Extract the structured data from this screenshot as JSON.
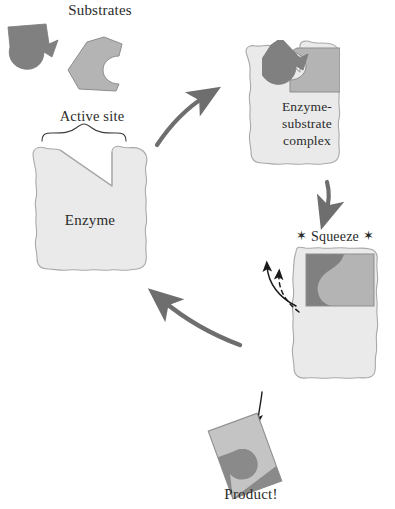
{
  "diagram": {
    "labels": {
      "substrates": "Substrates",
      "active_site": "Active site",
      "enzyme": "Enzyme",
      "complex_line1": "Enzyme-",
      "complex_line2": "substrate",
      "complex_line3": "complex",
      "squeeze": "Squeeze",
      "squeeze_star_left": "✶",
      "squeeze_star_right": "✶",
      "product": "Product!"
    },
    "colors": {
      "background": "#ffffff",
      "enzyme_fill": "#eaeaea",
      "enzyme_stroke": "#a9a9a9",
      "substrate_dark": "#808080",
      "substrate_light": "#b4b4b4",
      "substrate_stroke": "#8d8d8d",
      "arrow_gray": "#6e6e6e",
      "arrow_black": "#1a1a1a",
      "text": "#2b2b2b"
    },
    "stages": [
      {
        "id": "substrates",
        "name": "free substrates",
        "shapes": [
          "dark-substrate",
          "light-substrate"
        ]
      },
      {
        "id": "enzyme",
        "name": "free enzyme with open active site",
        "shapes": [
          "enzyme-body",
          "active-site-notch",
          "active-site-brace"
        ]
      },
      {
        "id": "enzyme-substrate-complex",
        "name": "substrates bound in active site",
        "shapes": [
          "enzyme-body",
          "dark-substrate-bound",
          "light-substrate-bound"
        ]
      },
      {
        "id": "squeeze",
        "name": "induced fit squeeze forms product",
        "shapes": [
          "enzyme-body-closed",
          "merged-product",
          "squeeze-solid-arrow",
          "squeeze-dashed-arrow"
        ]
      },
      {
        "id": "product",
        "name": "released product",
        "shapes": [
          "product-rectangle",
          "product-arrow"
        ]
      }
    ],
    "arrows": [
      {
        "id": "arrow-binding",
        "from": "substrates",
        "to": "enzyme-substrate-complex",
        "style": "curved-solid",
        "color": "#6e6e6e"
      },
      {
        "id": "arrow-to-squeeze",
        "from": "enzyme-substrate-complex",
        "to": "squeeze",
        "style": "straight-down",
        "color": "#6e6e6e"
      },
      {
        "id": "arrow-recycle",
        "from": "squeeze",
        "to": "enzyme",
        "style": "curved-solid",
        "color": "#6e6e6e"
      },
      {
        "id": "arrow-product-release",
        "from": "squeeze",
        "to": "product",
        "style": "thin-down",
        "color": "#1a1a1a"
      },
      {
        "id": "arrow-squeeze-solid",
        "from": "enzyme-edge",
        "to": "up-left",
        "style": "curved-solid-thin",
        "color": "#1a1a1a"
      },
      {
        "id": "arrow-squeeze-dashed",
        "from": "enzyme-edge",
        "to": "up-left",
        "style": "curved-dashed",
        "color": "#1a1a1a"
      }
    ]
  }
}
